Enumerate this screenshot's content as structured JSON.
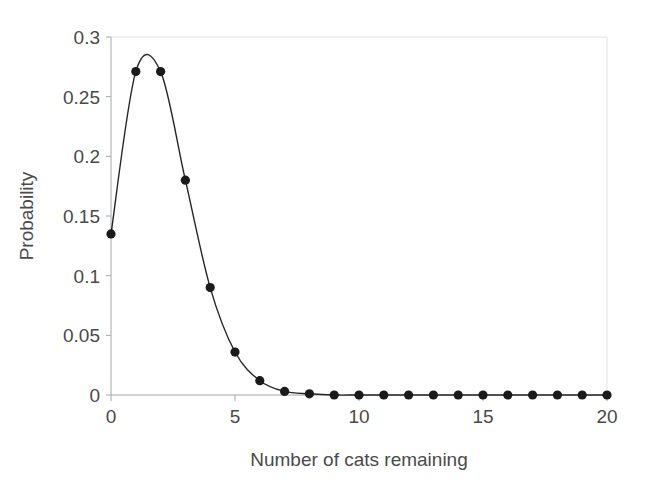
{
  "chart_data": {
    "type": "line",
    "title": "",
    "subtitle": "",
    "xlabel": "Number of cats remaining",
    "ylabel": "Probability",
    "x": [
      0,
      1,
      2,
      3,
      4,
      5,
      6,
      7,
      8,
      9,
      10,
      11,
      12,
      13,
      14,
      15,
      16,
      17,
      18,
      19,
      20
    ],
    "series": [
      {
        "name": "Probability",
        "values": [
          0.135,
          0.271,
          0.271,
          0.18,
          0.09,
          0.036,
          0.012,
          0.003,
          0.001,
          0.0,
          0.0,
          0.0,
          0.0,
          0.0,
          0.0,
          0.0,
          0.0,
          0.0,
          0.0,
          0.0,
          0.0
        ],
        "marker": "filled-circle",
        "marker_color": "#1a1a1a",
        "line_color": "#262626",
        "smooth": true
      }
    ],
    "xlim": [
      0,
      20
    ],
    "ylim": [
      0,
      0.3
    ],
    "xticks": [
      0,
      5,
      10,
      15,
      20
    ],
    "xtick_labels": [
      "0",
      "5",
      "10",
      "15",
      "20"
    ],
    "yticks": [
      0,
      0.05,
      0.1,
      0.15,
      0.2,
      0.25,
      0.3
    ],
    "ytick_labels": [
      "0",
      "0.05",
      "0.1",
      "0.15",
      "0.2",
      "0.25",
      "0.3"
    ],
    "grid": false,
    "legend": false,
    "legend_position": "none",
    "background_color": "#ffffff",
    "axis_color": "#a6a6a6",
    "text_color": "#4a4a4a",
    "border_color": "#e2e2e2"
  }
}
